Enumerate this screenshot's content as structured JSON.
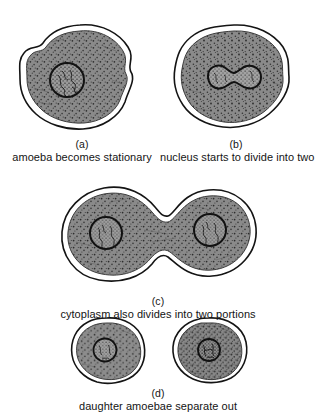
{
  "figure": {
    "background_color": "#ffffff",
    "ink_color": "#141414",
    "cytoplasm_color": "#8a8a8a",
    "stipple_color": "#2b2b2b",
    "membrane_gap_color": "#ffffff",
    "nucleus_fill_color": "#9a9a9a"
  },
  "stages": [
    {
      "id": "a",
      "letter": "(a)",
      "caption": "amoeba becomes stationary",
      "cell_count": 1,
      "nucleus_count": 1,
      "nucleus_shape": "circle",
      "body_shape": "irregular-blob"
    },
    {
      "id": "b",
      "letter": "(b)",
      "caption": "nucleus starts to divide into two",
      "cell_count": 1,
      "nucleus_count": 1,
      "nucleus_shape": "dumbbell",
      "body_shape": "irregular-blob"
    },
    {
      "id": "c",
      "letter": "(c)",
      "caption": "cytoplasm also divides into two portions",
      "cell_count": 1,
      "nucleus_count": 2,
      "nucleus_shape": "circle",
      "body_shape": "peanut"
    },
    {
      "id": "d",
      "letter": "(d)",
      "caption": "daughter amoebae separate out",
      "cell_count": 2,
      "nucleus_count": 2,
      "nucleus_shape": "circle",
      "body_shape": "rounded-oval"
    }
  ]
}
